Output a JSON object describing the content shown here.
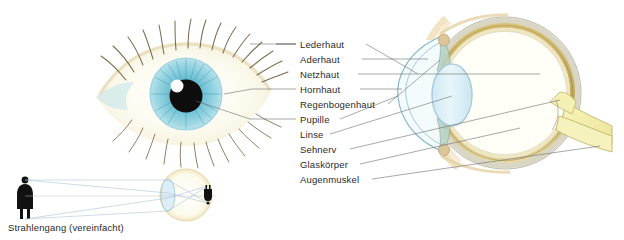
{
  "page": {
    "background": "#ffffff",
    "text_color": "#2b2b2b",
    "leader_color": "#6e6e6e"
  },
  "labels": [
    {
      "id": "lederhaut",
      "text": "Lederhaut",
      "x": 300,
      "y": 40
    },
    {
      "id": "aderhaut",
      "text": "Aderhaut",
      "x": 300,
      "y": 55
    },
    {
      "id": "netzhaut",
      "text": "Netzhaut",
      "x": 300,
      "y": 70
    },
    {
      "id": "hornhaut",
      "text": "Hornhaut",
      "x": 300,
      "y": 85
    },
    {
      "id": "regenbogenhaut",
      "text": "Regenbogenhaut",
      "x": 300,
      "y": 100
    },
    {
      "id": "pupille",
      "text": "Pupille",
      "x": 300,
      "y": 115
    },
    {
      "id": "linse",
      "text": "Linse",
      "x": 300,
      "y": 130
    },
    {
      "id": "sehnerv",
      "text": "Sehnerv",
      "x": 300,
      "y": 145
    },
    {
      "id": "glaskoerper",
      "text": "Glaskörper",
      "x": 300,
      "y": 160
    },
    {
      "id": "augenmuskel",
      "text": "Augenmuskel",
      "x": 300,
      "y": 175
    }
  ],
  "caption": {
    "text": "Strahlengang (vereinfacht)"
  },
  "colors": {
    "sclera": "#e8e2cc",
    "sclera_line": "#8a8a7a",
    "choroid": "#c9b36a",
    "choroid_dark": "#9a8340",
    "retina": "#efe6c2",
    "cornea": "#7fb2cc",
    "lens_fill": "#dff0f6",
    "lens_line": "#7fb2cc",
    "iris_body": "#9fc9b8",
    "optic_nerve": "#f4f0b4",
    "optic_nerve_line": "#b9ae62",
    "iris_photo": "#63b9cf",
    "iris_photo_dark": "#2f8aa6",
    "pupil": "#0d0d0d",
    "lash": "#6b5a3a",
    "skin_tint": "#f7f3dc",
    "figure": "#111111",
    "ray": "#9bb8cc"
  },
  "diagram": {
    "eye_photo": {
      "cx": 186,
      "cy": 95,
      "label": "human-eye-photograph"
    },
    "eye_section": {
      "cx": 505,
      "cy": 93,
      "r": 78,
      "label": "eye-cross-section"
    },
    "ray_diagram": {
      "label": "simplified-light-path-diagram",
      "object_x": 25,
      "eye_cx": 186,
      "eye_cy": 195,
      "eye_r": 26
    }
  }
}
